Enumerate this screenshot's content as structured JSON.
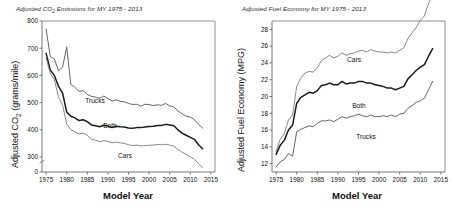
{
  "figure": {
    "background": "#ffffff",
    "ink": "#111111"
  },
  "panels": [
    {
      "id": "co2",
      "title_prefix": "Adjusted CO",
      "title_sub": "2",
      "title_suffix": " Emissions for MY 1975 - 2013",
      "ylabel_prefix": "Adjusted CO",
      "ylabel_sub": "2",
      "ylabel_suffix": " (grams/mile)",
      "xlabel": "Model Year",
      "label_trucks": "Trucks",
      "label_both": "Both",
      "label_cars": "Cars"
    },
    {
      "id": "mpg",
      "title_prefix": "Adjusted Fuel  Economy for MY 1975 - 2013",
      "title_sub": "",
      "title_suffix": "",
      "ylabel_prefix": "Adjusted Fuel Economy (MPG)",
      "ylabel_sub": "",
      "ylabel_suffix": "",
      "xlabel": "Model Year",
      "label_trucks": "Trucks",
      "label_both": "Both",
      "label_cars": "Cars"
    }
  ],
  "chart_data": [
    {
      "type": "line",
      "id": "co2",
      "title": "Adjusted CO2 Emissions for MY 1975 - 2013",
      "xlabel": "Model Year",
      "ylabel": "Adjusted CO2 (grams/mile)",
      "xlim": [
        1974,
        2016
      ],
      "ylim": [
        0,
        800
      ],
      "y_axis_break": true,
      "yticks": [
        0,
        300,
        400,
        500,
        600,
        700,
        800
      ],
      "xticks": [
        1975,
        1980,
        1985,
        1990,
        1995,
        2000,
        2005,
        2010,
        2015
      ],
      "grid": false,
      "legend": "inline-labels",
      "x": [
        1975,
        1976,
        1977,
        1978,
        1979,
        1980,
        1981,
        1982,
        1983,
        1984,
        1985,
        1986,
        1987,
        1988,
        1989,
        1990,
        1991,
        1992,
        1993,
        1994,
        1995,
        1996,
        1997,
        1998,
        1999,
        2000,
        2001,
        2002,
        2003,
        2004,
        2005,
        2006,
        2007,
        2008,
        2009,
        2010,
        2011,
        2012,
        2013
      ],
      "series": [
        {
          "name": "Trucks",
          "color": "#555555",
          "width": 0.9,
          "values": [
            770,
            670,
            660,
            617,
            630,
            705,
            567,
            556,
            541,
            544,
            530,
            523,
            520,
            516,
            524,
            515,
            506,
            510,
            505,
            503,
            497,
            493,
            494,
            487,
            494,
            493,
            489,
            492,
            490,
            497,
            488,
            484,
            470,
            459,
            450,
            447,
            437,
            420,
            406
          ]
        },
        {
          "name": "Both",
          "color": "#1a1a1a",
          "width": 1.5,
          "values": [
            681,
            620,
            600,
            560,
            535,
            465,
            450,
            444,
            434,
            437,
            430,
            418,
            415,
            411,
            417,
            414,
            408,
            413,
            411,
            410,
            407,
            406,
            408,
            408,
            410,
            412,
            413,
            416,
            416,
            420,
            418,
            415,
            400,
            388,
            380,
            372,
            365,
            345,
            330
          ]
        },
        {
          "name": "Cars",
          "color": "#7a7a7a",
          "width": 0.9,
          "values": [
            665,
            608,
            585,
            520,
            490,
            421,
            401,
            392,
            385,
            388,
            380,
            365,
            362,
            356,
            360,
            358,
            352,
            355,
            352,
            350,
            345,
            342,
            344,
            341,
            342,
            343,
            344,
            346,
            345,
            347,
            344,
            340,
            328,
            318,
            310,
            300,
            292,
            275,
            260
          ]
        }
      ]
    },
    {
      "type": "line",
      "id": "mpg",
      "title": "Adjusted Fuel Economy for MY 1975 - 2013",
      "xlabel": "Model Year",
      "ylabel": "Adjusted Fuel Economy (MPG)",
      "xlim": [
        1974,
        2016
      ],
      "ylim": [
        11,
        29
      ],
      "y_axis_break": false,
      "yticks": [
        12,
        14,
        16,
        18,
        20,
        22,
        24,
        26,
        28
      ],
      "xticks": [
        1975,
        1980,
        1985,
        1990,
        1995,
        2000,
        2005,
        2010,
        2015
      ],
      "grid": false,
      "legend": "inline-labels",
      "x": [
        1975,
        1976,
        1977,
        1978,
        1979,
        1980,
        1981,
        1982,
        1983,
        1984,
        1985,
        1986,
        1987,
        1988,
        1989,
        1990,
        1991,
        1992,
        1993,
        1994,
        1995,
        1996,
        1997,
        1998,
        1999,
        2000,
        2001,
        2002,
        2003,
        2004,
        2005,
        2006,
        2007,
        2008,
        2009,
        2010,
        2011,
        2012,
        2013
      ],
      "series": [
        {
          "name": "Cars",
          "color": "#7a7a7a",
          "width": 0.9,
          "values": [
            13.5,
            14.9,
            15.6,
            17.2,
            17.8,
            21.2,
            22.2,
            22.8,
            23.0,
            22.9,
            23.4,
            24.3,
            24.6,
            24.9,
            24.6,
            24.8,
            25.2,
            24.9,
            25.1,
            25.2,
            25.4,
            25.5,
            25.3,
            25.6,
            25.4,
            25.3,
            25.3,
            25.2,
            25.3,
            25.2,
            25.5,
            25.8,
            26.9,
            27.6,
            28.2,
            29.1,
            29.6,
            31.1,
            32.0
          ],
          "display_values": [
            13.5,
            14.9,
            15.6,
            17.2,
            17.8,
            21.2,
            22.2,
            22.8,
            23.0,
            22.9,
            23.4,
            24.3,
            24.6,
            24.9,
            24.6,
            24.8,
            25.2,
            24.9,
            25.1,
            25.2,
            25.4,
            25.5,
            25.3,
            25.6,
            25.4,
            25.3,
            25.3,
            25.2,
            25.3,
            25.2,
            25.5,
            25.8,
            26.9,
            27.6,
            28.2,
            29.1,
            29.6,
            31.1,
            32.0
          ]
        },
        {
          "name": "Both",
          "color": "#1a1a1a",
          "width": 1.5,
          "values": [
            13.1,
            14.2,
            14.8,
            16.0,
            16.6,
            19.2,
            19.9,
            20.2,
            20.5,
            20.4,
            20.7,
            21.3,
            21.4,
            21.6,
            21.4,
            21.4,
            21.8,
            21.5,
            21.6,
            21.6,
            21.8,
            21.8,
            21.6,
            21.6,
            21.4,
            21.3,
            21.2,
            21.0,
            21.0,
            20.8,
            21.0,
            21.2,
            22.1,
            22.6,
            23.1,
            23.5,
            23.8,
            24.8,
            25.7
          ],
          "display_values": [
            13.1,
            14.2,
            14.8,
            16.0,
            16.6,
            19.2,
            19.9,
            20.2,
            20.5,
            20.4,
            20.7,
            21.3,
            21.4,
            21.6,
            21.4,
            21.4,
            21.8,
            21.5,
            21.6,
            21.6,
            21.8,
            21.8,
            21.6,
            21.6,
            21.4,
            21.3,
            21.2,
            21.0,
            21.0,
            20.8,
            21.0,
            21.2,
            22.1,
            22.6,
            23.1,
            23.5,
            23.8,
            24.8,
            25.7
          ]
        },
        {
          "name": "Trucks",
          "color": "#555555",
          "width": 0.9,
          "values": [
            11.6,
            12.2,
            12.5,
            13.2,
            12.9,
            15.8,
            16.1,
            16.3,
            16.5,
            16.4,
            16.8,
            17.1,
            17.1,
            17.2,
            17.0,
            17.3,
            17.6,
            17.4,
            17.6,
            17.7,
            17.9,
            17.7,
            17.6,
            17.8,
            17.6,
            17.6,
            17.7,
            17.6,
            17.8,
            17.6,
            17.9,
            18.0,
            18.6,
            18.9,
            19.3,
            19.5,
            19.8,
            20.8,
            21.8
          ],
          "display_values": [
            11.6,
            12.2,
            12.5,
            13.2,
            12.9,
            15.8,
            16.1,
            16.3,
            16.5,
            16.4,
            16.8,
            17.1,
            17.1,
            17.2,
            17.0,
            17.3,
            17.6,
            17.4,
            17.6,
            17.7,
            17.9,
            17.7,
            17.6,
            17.8,
            17.6,
            17.6,
            17.7,
            17.6,
            17.8,
            17.6,
            17.9,
            18.0,
            18.6,
            18.9,
            19.3,
            19.5,
            19.8,
            20.8,
            21.8
          ]
        }
      ]
    }
  ]
}
